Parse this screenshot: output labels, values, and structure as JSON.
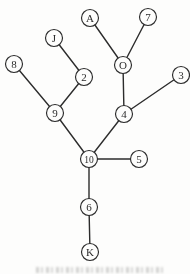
{
  "figure": {
    "kind": "undirected-graph-tree-figure",
    "background_color": "#fdfdfc",
    "caption": {
      "present": true,
      "legible": false
    }
  },
  "diagram": {
    "stroke_color": "#2c2c2c",
    "node_fill": "#fdfdfc",
    "node_radius": 8.5,
    "edge_width": 1.4,
    "node_stroke_width": 1.15,
    "label_font_size": 11,
    "label_font_size_wide": 9.5,
    "nodes": [
      {
        "id": "A",
        "label": "A",
        "x": 90,
        "y": 18
      },
      {
        "id": "7",
        "label": "7",
        "x": 148,
        "y": 17
      },
      {
        "id": "J",
        "label": "J",
        "x": 54,
        "y": 38
      },
      {
        "id": "O",
        "label": "O",
        "x": 123,
        "y": 65
      },
      {
        "id": "8",
        "label": "8",
        "x": 14,
        "y": 64
      },
      {
        "id": "2",
        "label": "2",
        "x": 84,
        "y": 77
      },
      {
        "id": "3",
        "label": "3",
        "x": 181,
        "y": 75
      },
      {
        "id": "9",
        "label": "9",
        "x": 55,
        "y": 113
      },
      {
        "id": "4",
        "label": "4",
        "x": 124,
        "y": 114
      },
      {
        "id": "10",
        "label": "10",
        "x": 89,
        "y": 159
      },
      {
        "id": "5",
        "label": "5",
        "x": 139,
        "y": 159
      },
      {
        "id": "6",
        "label": "6",
        "x": 89,
        "y": 207
      },
      {
        "id": "K",
        "label": "K",
        "x": 90,
        "y": 252
      }
    ],
    "edges": [
      {
        "from": "A",
        "to": "O"
      },
      {
        "from": "7",
        "to": "O"
      },
      {
        "from": "J",
        "to": "2"
      },
      {
        "from": "8",
        "to": "9"
      },
      {
        "from": "2",
        "to": "9"
      },
      {
        "from": "O",
        "to": "4"
      },
      {
        "from": "3",
        "to": "4"
      },
      {
        "from": "9",
        "to": "10"
      },
      {
        "from": "4",
        "to": "10"
      },
      {
        "from": "10",
        "to": "5"
      },
      {
        "from": "10",
        "to": "6"
      },
      {
        "from": "6",
        "to": "K"
      }
    ]
  }
}
